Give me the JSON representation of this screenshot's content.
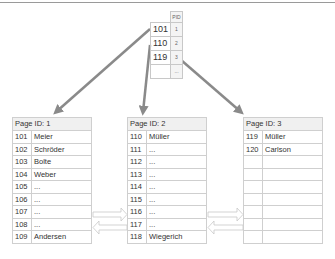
{
  "root_node": {
    "header_pid": "PID",
    "rows": [
      {
        "key": "101",
        "pid": "1"
      },
      {
        "key": "110",
        "pid": "2"
      },
      {
        "key": "119",
        "pid": "3"
      },
      {
        "key": "",
        "pid": "..."
      }
    ]
  },
  "pages": [
    {
      "title": "Page ID: 1",
      "rows": [
        {
          "key": "101",
          "name": "Meier"
        },
        {
          "key": "102",
          "name": "Schröder"
        },
        {
          "key": "103",
          "name": "Bolte"
        },
        {
          "key": "104",
          "name": "Weber"
        },
        {
          "key": "105",
          "name": "..."
        },
        {
          "key": "106",
          "name": "..."
        },
        {
          "key": "107",
          "name": "..."
        },
        {
          "key": "108",
          "name": "..."
        },
        {
          "key": "109",
          "name": "Andersen"
        }
      ]
    },
    {
      "title": "Page ID: 2",
      "rows": [
        {
          "key": "110",
          "name": "Müller"
        },
        {
          "key": "111",
          "name": "..."
        },
        {
          "key": "112",
          "name": "..."
        },
        {
          "key": "113",
          "name": "..."
        },
        {
          "key": "114",
          "name": "..."
        },
        {
          "key": "115",
          "name": "..."
        },
        {
          "key": "116",
          "name": "..."
        },
        {
          "key": "117",
          "name": "..."
        },
        {
          "key": "118",
          "name": "Wiegerich"
        }
      ]
    },
    {
      "title": "Page ID: 3",
      "rows": [
        {
          "key": "119",
          "name": "Müller"
        },
        {
          "key": "120",
          "name": "Carlson"
        },
        {
          "key": "",
          "name": ""
        },
        {
          "key": "",
          "name": ""
        },
        {
          "key": "",
          "name": ""
        },
        {
          "key": "",
          "name": ""
        },
        {
          "key": "",
          "name": ""
        },
        {
          "key": "",
          "name": ""
        },
        {
          "key": "",
          "name": ""
        }
      ]
    }
  ],
  "colors": {
    "pointer_arrow": "#8a8a8a",
    "link_arrow": "#c8c8c8"
  }
}
